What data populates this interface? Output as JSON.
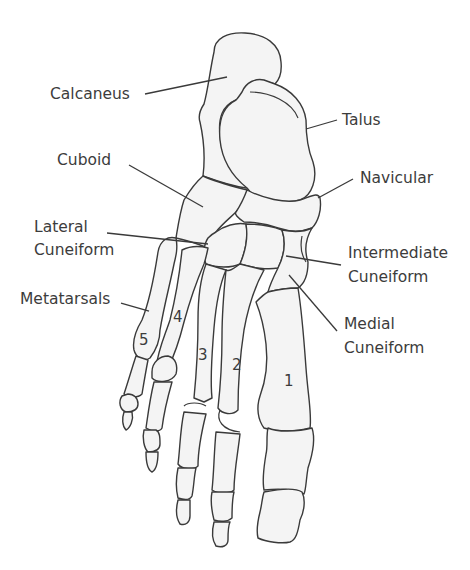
{
  "figure": {
    "colors": {
      "outline": "#3a3a3a",
      "bone_fill": "#f4f4f4",
      "text": "#3c3c3c",
      "background": "#ffffff"
    }
  },
  "labels": {
    "calcaneus": "Calcaneus",
    "talus": "Talus",
    "cuboid": "Cuboid",
    "navicular": "Navicular",
    "lateral_cuneiform_1": "Lateral",
    "lateral_cuneiform_2": "Cuneiform",
    "intermediate_cuneiform_1": "Intermediate",
    "intermediate_cuneiform_2": "Cuneiform",
    "metatarsals": "Metatarsals",
    "medial_cuneiform_1": "Medial",
    "medial_cuneiform_2": "Cuneiform"
  },
  "metatarsal_numbers": [
    "1",
    "2",
    "3",
    "4",
    "5"
  ]
}
